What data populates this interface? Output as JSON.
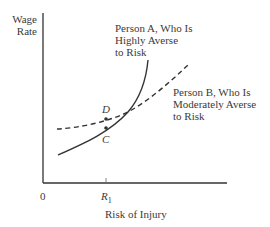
{
  "diagram": {
    "y_axis_label_line1": "Wage",
    "y_axis_label_line2": "Rate",
    "x_axis_label": "Risk of Injury",
    "origin_label": "0",
    "tick_label_main": "R",
    "tick_label_sub": "1",
    "curve_a_label": [
      "Person A, Who Is",
      "Highly Averse",
      "to Risk"
    ],
    "curve_b_label": [
      "Person B, Who Is",
      "Moderately Averse",
      "to Risk"
    ],
    "point_d_label": "D",
    "point_c_label": "C",
    "curve_a_style": "solid",
    "curve_b_style": "dashed",
    "line_color": "#333333"
  }
}
